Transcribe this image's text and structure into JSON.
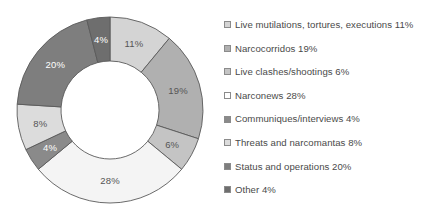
{
  "chart_data": {
    "type": "pie",
    "variant": "donut",
    "title": "",
    "xlabel": "",
    "ylabel": "",
    "units": "percent",
    "total": 100,
    "legend_position": "right",
    "grid": false,
    "start_angle_deg": -90,
    "direction": "clockwise",
    "categories": [
      "Live mutilations, tortures, executions",
      "Narcocorridos",
      "Live clashes/shootings",
      "Narconews",
      "Communiques/interviews",
      "Threats and narcomantas",
      "Status and operations",
      "Other"
    ],
    "values": [
      11,
      19,
      6,
      28,
      4,
      8,
      20,
      4
    ],
    "value_labels": [
      "11%",
      "19%",
      "6%",
      "28%",
      "4%",
      "8%",
      "20%",
      "4%"
    ],
    "colors": [
      "#d4d4d4",
      "#b0b0b0",
      "#c4c4c4",
      "#f4f4f4",
      "#8a8a8a",
      "#dcdcdc",
      "#7e7e7e",
      "#6e6e6e"
    ],
    "label_text_colors": [
      "#555555",
      "#555555",
      "#555555",
      "#555555",
      "#ffffff",
      "#555555",
      "#ffffff",
      "#ffffff"
    ],
    "stroke": "#5a5a5a",
    "slices": [
      {
        "name": "Live mutilations, tortures, executions",
        "value": 11,
        "label": "11%",
        "color": "#d4d4d4"
      },
      {
        "name": "Narcocorridos",
        "value": 19,
        "label": "19%",
        "color": "#b0b0b0"
      },
      {
        "name": "Live clashes/shootings",
        "value": 6,
        "label": "6%",
        "color": "#c4c4c4"
      },
      {
        "name": "Narconews",
        "value": 28,
        "label": "28%",
        "color": "#f4f4f4"
      },
      {
        "name": "Communiques/interviews",
        "value": 4,
        "label": "4%",
        "color": "#8a8a8a"
      },
      {
        "name": "Threats and narcomantas",
        "value": 8,
        "label": "8%",
        "color": "#dcdcdc"
      },
      {
        "name": "Status and operations",
        "value": 20,
        "label": "20%",
        "color": "#7e7e7e"
      },
      {
        "name": "Other",
        "value": 4,
        "label": "4%",
        "color": "#6e6e6e"
      }
    ]
  },
  "legend": {
    "items": [
      {
        "label": "Live mutilations, tortures, executions 11%",
        "color": "#d4d4d4"
      },
      {
        "label": "Narcocorridos 19%",
        "color": "#b0b0b0"
      },
      {
        "label": "Live clashes/shootings 6%",
        "color": "#c4c4c4"
      },
      {
        "label": "Narconews 28%",
        "color": "#ffffff"
      },
      {
        "label": "Communiques/interviews 4%",
        "color": "#8a8a8a"
      },
      {
        "label": "Threats and narcomantas 8%",
        "color": "#dcdcdc"
      },
      {
        "label": "Status and operations 20%",
        "color": "#7e7e7e"
      },
      {
        "label": "Other 4%",
        "color": "#6e6e6e"
      }
    ]
  }
}
